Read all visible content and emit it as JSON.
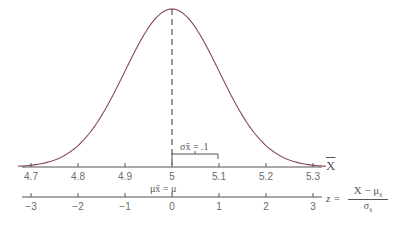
{
  "figure": {
    "type": "normal-distribution-diagram",
    "curve_color": "#8a4a55",
    "axis_color": "#555555",
    "text_color": "#6a6a6a"
  },
  "x_axis": {
    "label": "X",
    "label_has_overbar": true,
    "ticks": [
      "4.7",
      "4.8",
      "4.9",
      "5",
      "5.1",
      "5.2",
      "5.3"
    ]
  },
  "z_axis": {
    "label_lhs": "z =",
    "numerator": "X − μ",
    "numerator_sub": "x̄",
    "denominator": "σ",
    "denominator_sub": "x̄",
    "ticks": [
      "−3",
      "−2",
      "−1",
      "0",
      "1",
      "2",
      "3"
    ]
  },
  "annotations": {
    "mean_label": "μx̄ = μ",
    "sigma_label": "σx̄ = .1"
  },
  "chart_data": {
    "type": "line",
    "title": "",
    "mean": 5,
    "std_error": 0.1,
    "x": [
      4.7,
      4.8,
      4.9,
      5.0,
      5.1,
      5.2,
      5.3
    ],
    "z": [
      -3,
      -2,
      -1,
      0,
      1,
      2,
      3
    ],
    "xlabel": "X̄",
    "zlabel": "z = (X̄ − μx̄)/σx̄",
    "xlim": [
      4.7,
      5.3
    ],
    "grid": false,
    "legend": null
  }
}
